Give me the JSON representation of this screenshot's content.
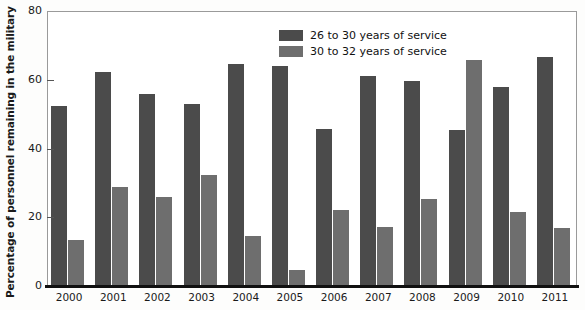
{
  "chart_data": {
    "type": "bar",
    "title": "",
    "xlabel": "",
    "ylabel": "Percentage of personnel remaining in the military",
    "ylim": [
      0,
      80
    ],
    "yticks": [
      0,
      20,
      40,
      60,
      80
    ],
    "ytick_labels": [
      "0",
      "20",
      "40",
      "60",
      "80"
    ],
    "grid": false,
    "legend_position": "top-center",
    "categories": [
      "2000",
      "2001",
      "2002",
      "2003",
      "2004",
      "2005",
      "2006",
      "2007",
      "2008",
      "2009",
      "2010",
      "2011"
    ],
    "series": [
      {
        "name": "26 to 30 years of service",
        "color": "#4b4b4b",
        "values": [
          52.3,
          62.2,
          56.0,
          53.0,
          64.6,
          64.0,
          45.6,
          61.2,
          59.5,
          45.4,
          58.0,
          66.6
        ]
      },
      {
        "name": "30 to 32 years of service",
        "color": "#6e6e6e",
        "values": [
          13.5,
          28.7,
          25.9,
          32.2,
          14.6,
          4.8,
          22.0,
          17.2,
          25.4,
          65.8,
          21.6,
          16.8
        ]
      }
    ]
  },
  "legend": {
    "items": [
      {
        "label": "26 to 30 years of service",
        "swatch": "dark"
      },
      {
        "label": "30 to 32 years of service",
        "swatch": "light"
      }
    ]
  },
  "colors": {
    "series_dark": "#4b4b4b",
    "series_light": "#6e6e6e",
    "axis": "#111111",
    "frame": "#9a9a9a",
    "background": "#ffffff"
  }
}
